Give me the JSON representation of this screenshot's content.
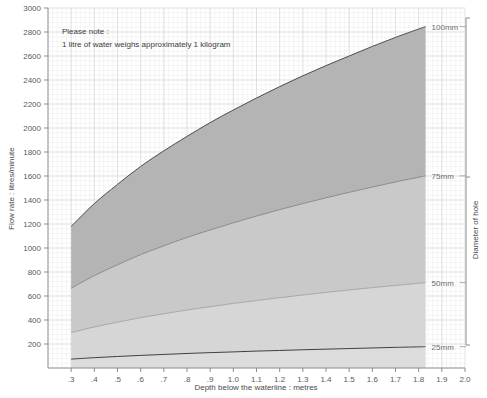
{
  "chart_data": {
    "type": "area",
    "title": "",
    "xlabel": "Depth below the waterline : metres",
    "ylabel": "Flow rate : litres/minute",
    "xlim": [
      0.2,
      2.0
    ],
    "ylim": [
      0,
      3000
    ],
    "xticks": [
      ".3",
      ".4",
      ".5",
      ".6",
      ".7",
      ".8",
      ".9",
      "1.0",
      "1.1",
      "1.2",
      "1.3",
      "1.4",
      "1.5",
      "1.6",
      "1.7",
      "1.8",
      "1.9",
      "2.0"
    ],
    "xtick_values": [
      0.3,
      0.4,
      0.5,
      0.6,
      0.7,
      0.8,
      0.9,
      1.0,
      1.1,
      1.2,
      1.3,
      1.4,
      1.5,
      1.6,
      1.7,
      1.8,
      1.9,
      2.0
    ],
    "yticks": [
      "200",
      "400",
      "600",
      "800",
      "1000",
      "1200",
      "1400",
      "1600",
      "1800",
      "2000",
      "2200",
      "2400",
      "2600",
      "2800",
      "3000"
    ],
    "ytick_values": [
      200,
      400,
      600,
      800,
      1000,
      1200,
      1400,
      1600,
      1800,
      2000,
      2200,
      2400,
      2600,
      2800,
      3000
    ],
    "grid": true,
    "grid_minor": true,
    "legend_position": "right",
    "data_x_max": 1.83,
    "x": [
      0.3,
      0.4,
      0.5,
      0.6,
      0.7,
      0.8,
      0.9,
      1.0,
      1.1,
      1.2,
      1.3,
      1.4,
      1.5,
      1.6,
      1.7,
      1.8,
      1.83
    ],
    "series": [
      {
        "name": "100mm",
        "label": "100mm",
        "fill": "#b4b4b4",
        "stroke": "#4d4d4d",
        "values": [
          1180,
          1370,
          1530,
          1680,
          1810,
          1930,
          2045,
          2150,
          2250,
          2345,
          2435,
          2520,
          2600,
          2680,
          2755,
          2825,
          2845
        ]
      },
      {
        "name": "75mm",
        "label": "75mm",
        "fill": "#c9c9c9",
        "stroke": "#7a7a7a",
        "values": [
          665,
          770,
          860,
          945,
          1018,
          1088,
          1150,
          1210,
          1266,
          1320,
          1370,
          1418,
          1464,
          1508,
          1550,
          1590,
          1601
        ]
      },
      {
        "name": "50mm",
        "label": "50mm",
        "fill": "#d6d6d6",
        "stroke": "#9b9b9b",
        "values": [
          295,
          342,
          382,
          420,
          452,
          483,
          511,
          538,
          562,
          586,
          608,
          630,
          650,
          670,
          688,
          706,
          711
        ]
      },
      {
        "name": "25mm",
        "label": "25mm",
        "fill": "#dcdcdc",
        "stroke": "#3f3f3f",
        "values": [
          74,
          86,
          96,
          105,
          113,
          121,
          128,
          134,
          141,
          146,
          152,
          157,
          162,
          167,
          172,
          176,
          178
        ]
      }
    ],
    "annotations": [
      {
        "name": "note-line-1",
        "text": "Please note :"
      },
      {
        "name": "note-line-2",
        "text": "1 litre of water weighs approximately 1 kilogram"
      }
    ],
    "bracket_label": "Diameter of hole"
  },
  "note": {
    "line1": "Please note :",
    "line2": "1 litre of water weighs approximately 1 kilogram"
  },
  "axes": {
    "y_title": "Flow rate : litres/minute",
    "x_title": "Depth below the waterline : metres",
    "right_title": "Diameter of hole"
  },
  "colors": {
    "grid_major": "#d8d8d8",
    "grid_minor": "#ececec",
    "axis": "#8c8c8c",
    "text": "#555555",
    "band_100": "#b4b4b4",
    "band_75": "#c9c9c9",
    "band_50": "#d6d6d6",
    "band_25": "#dcdcdc"
  }
}
